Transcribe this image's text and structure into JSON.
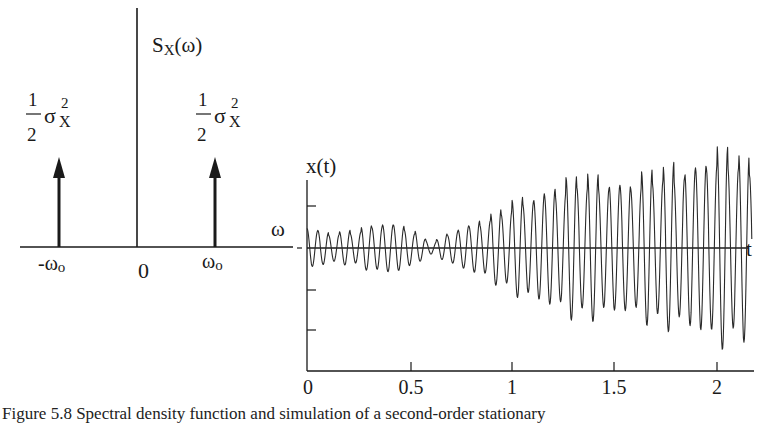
{
  "chart_data": [
    {
      "type": "line",
      "subtype": "spectral-impulses",
      "title": "",
      "ylabel": "S_X(ω)",
      "xlabel": "ω",
      "x_ticks": [
        "-ω0",
        "0",
        "ω0"
      ],
      "impulses": [
        {
          "x": "-ω0",
          "height_label": "1/2 σX²"
        },
        {
          "x": "ω0",
          "height_label": "1/2 σX²"
        }
      ],
      "grid": false
    },
    {
      "type": "line",
      "title": "",
      "xlabel": "t",
      "ylabel": "x(t)",
      "x_ticks": [
        0,
        0.5,
        1,
        1.5,
        2
      ],
      "xlim": [
        0,
        2.17
      ],
      "y_ticks_count": 4,
      "ylim": [
        -3,
        3
      ],
      "grid": false,
      "series": [
        {
          "name": "x(t)",
          "frequency_cycles_per_unit": 19,
          "envelope_t": [
            0,
            0.1,
            0.2,
            0.3,
            0.4,
            0.5,
            0.58,
            0.62,
            0.7,
            0.8,
            0.9,
            1.0,
            1.1,
            1.2,
            1.3,
            1.4,
            1.5,
            1.6,
            1.7,
            1.8,
            1.9,
            2.0,
            2.1,
            2.17
          ],
          "envelope_amplitude": [
            0.45,
            0.35,
            0.4,
            0.5,
            0.55,
            0.5,
            0.2,
            0.15,
            0.35,
            0.55,
            0.8,
            1.0,
            1.15,
            1.45,
            1.6,
            1.55,
            1.55,
            1.6,
            1.7,
            1.85,
            2.0,
            2.15,
            2.1,
            2.05
          ]
        }
      ]
    }
  ],
  "left_plot": {
    "y_label_main": "S",
    "y_label_sub": "X",
    "y_label_arg": "(ω)",
    "x_axis_label": "ω",
    "tick_neg": "-ω",
    "tick_neg_sub": "o",
    "tick_zero": "0",
    "tick_pos": "ω",
    "tick_pos_sub": "o",
    "impulse_num": "1",
    "impulse_den": "2",
    "impulse_sigma": "σ",
    "impulse_sup": "2",
    "impulse_sub": "X"
  },
  "right_plot": {
    "y_label": "x(t)",
    "x_axis_label": "t",
    "x_ticks": [
      "0",
      "0.5",
      "1",
      "1.5",
      "2"
    ]
  },
  "caption": "Figure 5.8  Spectral density function and simulation of a second-order stationary"
}
